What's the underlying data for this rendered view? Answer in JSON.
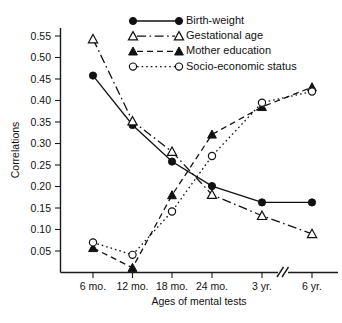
{
  "chart_data": {
    "type": "line",
    "title": "",
    "xlabel": "Ages of mental tests",
    "ylabel": "Correlations",
    "categories": [
      "6 mo.",
      "12 mo.",
      "18 mo.",
      "24 mo.",
      "3 yr.",
      "6 yr."
    ],
    "ylim": [
      0,
      0.575
    ],
    "yticks": [
      0.05,
      0.1,
      0.15,
      0.2,
      0.25,
      0.3,
      0.35,
      0.4,
      0.45,
      0.5,
      0.55
    ],
    "ytick_labels": [
      "0.05",
      "0.10",
      "0.15",
      "0.20",
      "0.25",
      "0.30",
      "0.35",
      "0.40",
      "0.45",
      "0.50",
      "0.55"
    ],
    "grid": false,
    "legend_position": "top-right",
    "x_axis_break_between": [
      "3 yr.",
      "6 yr."
    ],
    "series": [
      {
        "name": "Birth-weight",
        "marker": "filled-circle",
        "line_style": "solid",
        "values": [
          0.458,
          0.343,
          0.258,
          0.201,
          0.163,
          0.163
        ]
      },
      {
        "name": "Gestational age",
        "marker": "open-triangle",
        "line_style": "dash-dot",
        "values": [
          0.543,
          0.352,
          0.281,
          0.181,
          0.132,
          0.09
        ]
      },
      {
        "name": "Mother education",
        "marker": "filled-triangle",
        "line_style": "dashed",
        "values": [
          0.057,
          0.011,
          0.18,
          0.321,
          0.385,
          0.431
        ]
      },
      {
        "name": "Socio-economic status",
        "marker": "open-circle",
        "line_style": "dotted",
        "values": [
          0.07,
          0.041,
          0.142,
          0.271,
          0.395,
          0.421
        ]
      }
    ]
  },
  "legend": {
    "entries": [
      {
        "label": "Birth-weight"
      },
      {
        "label": "Gestational age"
      },
      {
        "label": "Mother education"
      },
      {
        "label": "Socio-economic status"
      }
    ]
  }
}
